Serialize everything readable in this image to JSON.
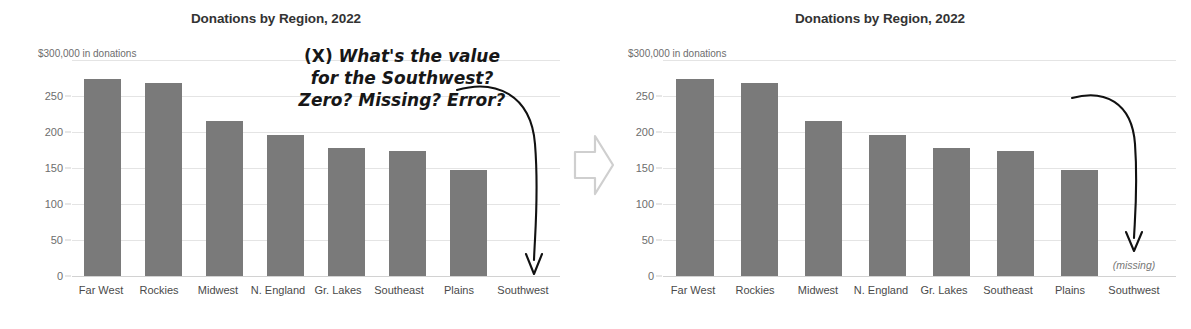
{
  "chart_data": [
    {
      "panel": "before",
      "type": "bar",
      "title": "Donations by Region, 2022",
      "axis_caption": "$300,000 in donations",
      "xlabel": "",
      "ylabel": "",
      "ylim": [
        0,
        300
      ],
      "yticks": [
        "250",
        "200",
        "150",
        "100",
        "50",
        "0"
      ],
      "ytick_values": [
        250,
        200,
        150,
        100,
        50,
        0
      ],
      "grid": true,
      "legend": "none",
      "categories": [
        "Far West",
        "Rockies",
        "Midwest",
        "N. England",
        "Gr. Lakes",
        "Southeast",
        "Plains",
        "Southwest"
      ],
      "values": [
        273,
        268,
        215,
        196,
        178,
        174,
        147,
        null
      ],
      "missing_label": "",
      "bar_color": "#7a7a7a",
      "annotation": {
        "mark": "(X)",
        "text": "What's the value\nfor the Southwest?\nZero? Missing? Error?",
        "points_to": "Southwest"
      }
    },
    {
      "panel": "after",
      "type": "bar",
      "title": "Donations by Region, 2022",
      "axis_caption": "$300,000 in donations",
      "xlabel": "",
      "ylabel": "",
      "ylim": [
        0,
        300
      ],
      "yticks": [
        "250",
        "200",
        "150",
        "100",
        "50",
        "0"
      ],
      "ytick_values": [
        250,
        200,
        150,
        100,
        50,
        0
      ],
      "grid": true,
      "legend": "none",
      "categories": [
        "Far West",
        "Rockies",
        "Midwest",
        "N. England",
        "Gr. Lakes",
        "Southeast",
        "Plains",
        "Southwest"
      ],
      "values": [
        273,
        268,
        215,
        196,
        178,
        174,
        147,
        null
      ],
      "missing_label": "(missing)",
      "bar_color": "#7a7a7a",
      "annotation": {
        "mark": "(✓)",
        "text": "Ah! No more\nambiguity.",
        "points_to": "Southwest"
      }
    }
  ],
  "left": {
    "title": "Donations by Region, 2022",
    "axis_caption": "$300,000 in donations",
    "yticks": [
      "250",
      "200",
      "150",
      "100",
      "50",
      "0"
    ],
    "categories": [
      "Far West",
      "Rockies",
      "Midwest",
      "N. England",
      "Gr. Lakes",
      "Southeast",
      "Plains",
      "Southwest"
    ],
    "note_mark": "(X)",
    "note_text": "What's the value\nfor the Southwest?\nZero? Missing? Error?"
  },
  "right": {
    "title": "Donations by Region, 2022",
    "axis_caption": "$300,000 in donations",
    "yticks": [
      "250",
      "200",
      "150",
      "100",
      "50",
      "0"
    ],
    "categories": [
      "Far West",
      "Rockies",
      "Midwest",
      "N. England",
      "Gr. Lakes",
      "Southeast",
      "Plains",
      "Southwest"
    ],
    "note_mark": "(✓)",
    "note_text": "Ah! No more\nambiguity.",
    "missing_label": "(missing)"
  },
  "colors": {
    "bar": "#7a7a7a",
    "gridline": "#e4e4e4",
    "text": "#4a4a4a",
    "annotation": "#171717"
  }
}
